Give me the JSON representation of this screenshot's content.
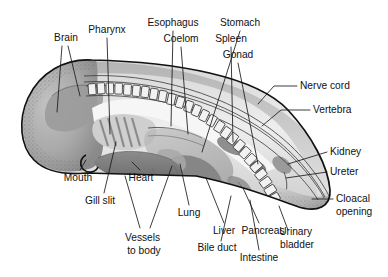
{
  "figure": {
    "type": "labeled-anatomical-diagram",
    "background_color": "#ffffff",
    "line_color": "#111111",
    "label_color": "#111111",
    "palette": {
      "outline": "#111111",
      "body_light": "#f4f4f4",
      "body_mid": "#c9c9c9",
      "body_dark": "#8d8d8d",
      "organ_dark": "#7a7a7a",
      "heart": "#6f6f6f",
      "vertebra_fill": "#f2f2f2"
    }
  },
  "labels": [
    {
      "id": "brain",
      "text": "Brain",
      "lines": [
        "Brain"
      ],
      "x": 66,
      "y": 38,
      "anchor": "middle"
    },
    {
      "id": "pharynx",
      "text": "Pharynx",
      "lines": [
        "Pharynx"
      ],
      "x": 107,
      "y": 30,
      "anchor": "middle"
    },
    {
      "id": "esophagus",
      "text": "Esophagus",
      "lines": [
        "Esophagus"
      ],
      "x": 173,
      "y": 23,
      "anchor": "middle"
    },
    {
      "id": "stomach",
      "text": "Stomach",
      "lines": [
        "Stomach"
      ],
      "x": 240,
      "y": 23,
      "anchor": "middle"
    },
    {
      "id": "coelom",
      "text": "Coelom",
      "lines": [
        "Coelom"
      ],
      "x": 181,
      "y": 39,
      "anchor": "middle"
    },
    {
      "id": "spleen",
      "text": "Spleen",
      "lines": [
        "Spleen"
      ],
      "x": 231,
      "y": 39,
      "anchor": "middle"
    },
    {
      "id": "gonad",
      "text": "Gonad",
      "lines": [
        "Gonad"
      ],
      "x": 238,
      "y": 55,
      "anchor": "middle"
    },
    {
      "id": "nerve-cord",
      "text": "Nerve cord",
      "lines": [
        "Nerve cord"
      ],
      "x": 300,
      "y": 86,
      "anchor": "start"
    },
    {
      "id": "vertebra",
      "text": "Vertebra",
      "lines": [
        "Vertebra"
      ],
      "x": 313,
      "y": 110,
      "anchor": "start"
    },
    {
      "id": "kidney",
      "text": "Kidney",
      "lines": [
        "Kidney"
      ],
      "x": 330,
      "y": 152,
      "anchor": "start"
    },
    {
      "id": "ureter",
      "text": "Ureter",
      "lines": [
        "Ureter"
      ],
      "x": 330,
      "y": 172,
      "anchor": "start"
    },
    {
      "id": "cloacal-opening",
      "text": "Cloacal opening",
      "lines": [
        "Cloacal",
        "opening"
      ],
      "x": 336,
      "y": 203,
      "anchor": "start"
    },
    {
      "id": "mouth",
      "text": "Mouth",
      "lines": [
        "Mouth"
      ],
      "x": 78,
      "y": 178,
      "anchor": "middle"
    },
    {
      "id": "gill-slit",
      "text": "Gill slit",
      "lines": [
        "Gill slit"
      ],
      "x": 100,
      "y": 201,
      "anchor": "middle"
    },
    {
      "id": "heart",
      "text": "Heart",
      "lines": [
        "Heart"
      ],
      "x": 141,
      "y": 178,
      "anchor": "middle"
    },
    {
      "id": "vessels-to-body",
      "text": "Vessels to body",
      "lines": [
        "Vessels",
        "to body"
      ],
      "x": 144,
      "y": 238,
      "anchor": "middle"
    },
    {
      "id": "lung",
      "text": "Lung",
      "lines": [
        "Lung"
      ],
      "x": 189,
      "y": 213,
      "anchor": "middle"
    },
    {
      "id": "liver",
      "text": "Liver",
      "lines": [
        "Liver"
      ],
      "x": 224,
      "y": 231,
      "anchor": "middle"
    },
    {
      "id": "pancreas",
      "text": "Pancreas",
      "lines": [
        "Pancreas"
      ],
      "x": 263,
      "y": 231,
      "anchor": "middle"
    },
    {
      "id": "bile-duct",
      "text": "Bile duct",
      "lines": [
        "Bile duct"
      ],
      "x": 217,
      "y": 248,
      "anchor": "middle"
    },
    {
      "id": "urinary-bladder",
      "text": "Urinary bladder",
      "lines": [
        "Urinary",
        "bladder"
      ],
      "x": 297,
      "y": 238,
      "anchor": "middle"
    },
    {
      "id": "intestine",
      "text": "Intestine",
      "lines": [
        "Intestine"
      ],
      "x": 259,
      "y": 258,
      "anchor": "middle"
    }
  ],
  "structures": [
    {
      "id": "body-outline",
      "name": "embryo-body-outline"
    },
    {
      "id": "head",
      "name": "head-region"
    },
    {
      "id": "brain-cavity",
      "name": "brain-cavity"
    },
    {
      "id": "vertebral-column",
      "name": "vertebral-column",
      "segment_count": 30
    },
    {
      "id": "nerve-cord-band",
      "name": "nerve-cord-band"
    },
    {
      "id": "pharynx-region",
      "name": "pharynx-region"
    },
    {
      "id": "gill-slits",
      "name": "gill-slit-bars",
      "count": 5
    },
    {
      "id": "heart-organ",
      "name": "heart-organ"
    },
    {
      "id": "esophagus-tube",
      "name": "esophagus-tube"
    },
    {
      "id": "stomach-organ",
      "name": "stomach-organ"
    },
    {
      "id": "spleen-organ",
      "name": "spleen-organ"
    },
    {
      "id": "gonad-organ",
      "name": "gonad-organ"
    },
    {
      "id": "liver-organ",
      "name": "liver-organ"
    },
    {
      "id": "lung-organ",
      "name": "lung-organ"
    },
    {
      "id": "kidney-organ",
      "name": "kidney-organ"
    },
    {
      "id": "bladder-organ",
      "name": "urinary-bladder-organ"
    },
    {
      "id": "intestine-loop",
      "name": "intestine-loop"
    },
    {
      "id": "tail",
      "name": "tail-region"
    },
    {
      "id": "mouth-notch",
      "name": "mouth-notch"
    }
  ]
}
